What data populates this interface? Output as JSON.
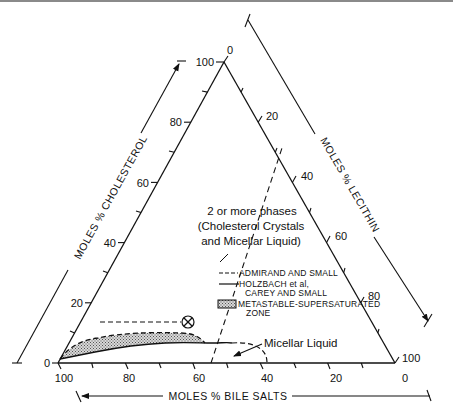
{
  "diagram": {
    "type": "ternary-phase-diagram",
    "vertices": {
      "top": "Cholesterol 100%",
      "left": "Bile Salts 100%",
      "right": "Lecithin 100%"
    },
    "axes": {
      "cholesterol": {
        "title": "MOLES % CHOLESTEROL",
        "ticks": [
          "0",
          "20",
          "40",
          "60",
          "80",
          "100"
        ]
      },
      "lecithin": {
        "title": "MOLES % LECITHIN",
        "ticks": [
          "0",
          "20",
          "40",
          "60",
          "80",
          "100"
        ]
      },
      "bile_salts": {
        "title": "MOLES % BILE SALTS",
        "ticks": [
          "100",
          "80",
          "60",
          "40",
          "20",
          "0"
        ]
      }
    },
    "regions": {
      "two_phase": {
        "line1": "2 or more phases",
        "line2": "(Cholesterol Crystals",
        "line3": "and Micellar Liquid)"
      },
      "micellar": "Micellar Liquid"
    },
    "legend": [
      {
        "style": "dashed",
        "label": "ADMIRAND AND SMALL"
      },
      {
        "style": "solid",
        "label_line1": "HOLZBACH et al,",
        "label_line2": "CAREY AND SMALL"
      },
      {
        "style": "stippled-box",
        "label_line1": "METASTABLE-SUPERSATURATED",
        "label_line2": "ZONE"
      }
    ],
    "marker": {
      "symbol": "circled-x",
      "cholesterol_pct": 15,
      "bile_salts_pct": 55
    },
    "colors": {
      "ink": "#111111",
      "stipple": "#9a9a9a",
      "background": "#ffffff"
    }
  }
}
